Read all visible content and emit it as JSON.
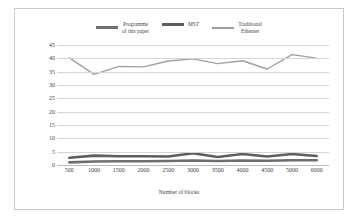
{
  "chart_data": {
    "type": "line",
    "title": "",
    "xlabel": "Number of blocks",
    "ylabel": "Enquiry Delay(ms)",
    "categories": [
      "500",
      "1000",
      "1500",
      "2000",
      "2500",
      "3000",
      "3500",
      "4000",
      "4500",
      "5000",
      "6000"
    ],
    "ylim": [
      0,
      45
    ],
    "yticks": [
      0,
      5,
      10,
      15,
      20,
      25,
      30,
      35,
      40,
      45
    ],
    "grid": true,
    "legend_position": "top-center",
    "series": [
      {
        "name": "Programme\nof this paper",
        "color": "#6f6f6f",
        "width": 2.6,
        "values": [
          1.0,
          1.3,
          1.4,
          1.4,
          1.5,
          1.7,
          1.5,
          1.7,
          1.6,
          1.8,
          1.8
        ]
      },
      {
        "name": "MST",
        "color": "#5e5e5e",
        "width": 2.6,
        "values": [
          2.7,
          3.5,
          3.3,
          3.3,
          3.2,
          4.4,
          3.0,
          4.1,
          3.2,
          4.1,
          3.4
        ]
      },
      {
        "name": "Traditional\nEthernet",
        "color": "#a0a0a0",
        "width": 1.4,
        "values": [
          40.2,
          34.0,
          37.0,
          36.8,
          39.0,
          39.8,
          38.0,
          39.1,
          36.0,
          41.4,
          40.1
        ]
      }
    ]
  },
  "legend": {
    "items": [
      {
        "label": "Programme\nof this paper",
        "color": "#6f6f6f",
        "thickness": "thick"
      },
      {
        "label": "MST",
        "color": "#5e5e5e",
        "thickness": "thick"
      },
      {
        "label": "Traditional\nEthernet",
        "color": "#a0a0a0",
        "thickness": "thin"
      }
    ]
  }
}
